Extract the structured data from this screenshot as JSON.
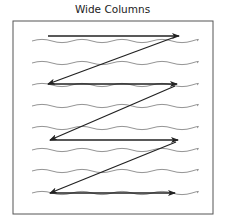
{
  "title": "Wide Columns",
  "diagram": {
    "frame": {
      "x": 13,
      "y": 21,
      "width": 200,
      "height": 193,
      "stroke": "#555555"
    },
    "text_lines_y": [
      41,
      63,
      85,
      106,
      128,
      150,
      171,
      193
    ],
    "wave_color": "#888888",
    "arrow_color": "#222222",
    "reading_path": [
      {
        "from": [
          48,
          36
        ],
        "to": [
          179,
          36
        ]
      },
      {
        "from": [
          175,
          37
        ],
        "to": [
          48,
          84
        ]
      },
      {
        "from": [
          48,
          84
        ],
        "to": [
          177,
          84
        ]
      },
      {
        "from": [
          175,
          86
        ],
        "to": [
          50,
          140
        ]
      },
      {
        "from": [
          50,
          140
        ],
        "to": [
          178,
          140
        ]
      },
      {
        "from": [
          176,
          142
        ],
        "to": [
          50,
          193
        ]
      },
      {
        "from": [
          50,
          193
        ],
        "to": [
          175,
          193
        ]
      }
    ]
  }
}
